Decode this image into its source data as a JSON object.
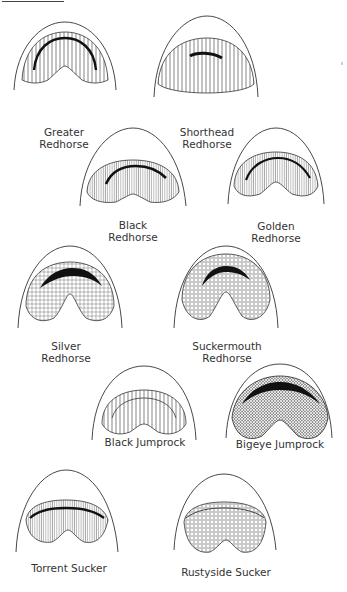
{
  "figure": {
    "specimens": [
      {
        "name_line1": "Greater",
        "name_line2": "Redhorse",
        "lip_texture": "plicate"
      },
      {
        "name_line1": "Shorthead",
        "name_line2": "Redhorse",
        "lip_texture": "plicate"
      },
      {
        "name_line1": "Black",
        "name_line2": "Redhorse",
        "lip_texture": "fine-plicate"
      },
      {
        "name_line1": "Golden",
        "name_line2": "Redhorse",
        "lip_texture": "fine-plicate"
      },
      {
        "name_line1": "Silver",
        "name_line2": "Redhorse",
        "lip_texture": "semi-papillose"
      },
      {
        "name_line1": "Suckermouth",
        "name_line2": "Redhorse",
        "lip_texture": "papillose"
      },
      {
        "name_line1": "Black Jumprock",
        "name_line2": "",
        "lip_texture": "plicate"
      },
      {
        "name_line1": "Bigeye Jumprock",
        "name_line2": "",
        "lip_texture": "papillose"
      },
      {
        "name_line1": "Torrent Sucker",
        "name_line2": "",
        "lip_texture": "fine-plicate"
      },
      {
        "name_line1": "Rustyside Sucker",
        "name_line2": "",
        "lip_texture": "papillose"
      }
    ]
  },
  "colors": {
    "ink": "#2a2a2a",
    "background": "#ffffff"
  }
}
